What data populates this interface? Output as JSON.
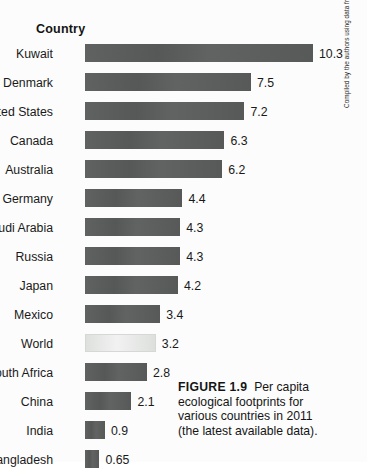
{
  "figure": {
    "axis_title": "Country",
    "caption_lead": "FIGURE 1.9",
    "caption_body": "Per capita ecological footprints for various countries in 2011 (the latest available data).",
    "source_credit": "Compiled by the authors using data from Global Footprint Network and WWF; Living Planet Report 2014."
  },
  "colors": {
    "bar": "#595a5a",
    "bar_highlight": "#e2e4e2",
    "background": "#fcfcfc",
    "text": "#1a1a1a"
  },
  "chart_data": {
    "type": "bar",
    "orientation": "horizontal",
    "xlabel": "",
    "ylabel": "Country",
    "xlim": [
      0,
      10.3
    ],
    "grid": false,
    "legend": "none",
    "categories": [
      "Kuwait",
      "Denmark",
      "United States",
      "Canada",
      "Australia",
      "Germany",
      "Saudi Arabia",
      "Russia",
      "Japan",
      "Mexico",
      "World",
      "South Africa",
      "China",
      "India",
      "Bangladesh"
    ],
    "values": [
      10.3,
      7.5,
      7.2,
      6.3,
      6.2,
      4.4,
      4.3,
      4.3,
      4.2,
      3.4,
      3.2,
      2.8,
      2.1,
      0.9,
      0.65
    ],
    "value_labels": [
      "10.3",
      "7.5",
      "7.2",
      "6.3",
      "6.2",
      "4.4",
      "4.3",
      "4.3",
      "4.2",
      "3.4",
      "3.2",
      "2.8",
      "2.1",
      "0.9",
      "0.65"
    ],
    "highlight_category": "World"
  }
}
